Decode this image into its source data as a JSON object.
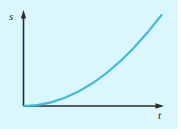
{
  "figure": {
    "name": "distance-time-graph",
    "background_color": "#d9f7fd",
    "outer_background_color": "#ffffff",
    "axis_color": "#2b2b2b",
    "curve_color": "#3fb8dc"
  },
  "axes": {
    "y": {
      "label": "s",
      "name": "vertical-axis",
      "has_arrow": true,
      "arrow_direction": "up"
    },
    "x": {
      "label": "t",
      "name": "horizontal-axis",
      "has_arrow": true,
      "arrow_direction": "right"
    }
  },
  "chart_data": {
    "type": "line",
    "title": "",
    "xlabel": "t",
    "ylabel": "s",
    "grid": false,
    "legend": false,
    "xlim": [
      0,
      1
    ],
    "ylim": [
      0,
      1
    ],
    "tick_labels": {
      "x": [],
      "y": []
    },
    "series": [
      {
        "name": "s(t)",
        "description": "monotonically increasing convex curve starting at the origin",
        "color": "#3fb8dc",
        "x": [
          0.0,
          0.1,
          0.2,
          0.3,
          0.4,
          0.5,
          0.6,
          0.7,
          0.8,
          0.9,
          1.0
        ],
        "y": [
          0.0,
          0.01,
          0.04,
          0.09,
          0.16,
          0.25,
          0.36,
          0.49,
          0.64,
          0.81,
          1.0
        ]
      }
    ],
    "annotations": []
  }
}
